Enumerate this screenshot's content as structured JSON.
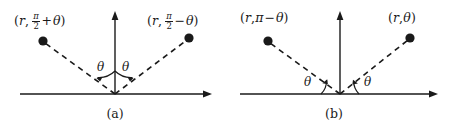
{
  "figure": {
    "background_color": "#ffffff",
    "ink_color": "#1a1a1a",
    "width": 451,
    "height": 132
  },
  "panels": [
    {
      "id": "a",
      "caption": "(a)",
      "symmetry": "reflection about the vertical (theta = pi/2) axis",
      "axes": {
        "origin_x": 115,
        "origin_y": 94,
        "x_axis_start": 20,
        "x_axis_end": 212,
        "y_axis_top": 12
      },
      "points": [
        {
          "name": "left-point",
          "dot_x": 43,
          "dot_y": 41,
          "label_prefix": "(",
          "label_r": "r",
          "label_comma": ",",
          "frac_num": "π",
          "frac_den": "2",
          "label_operator": "+",
          "label_theta": "θ",
          "label_suffix": ")",
          "label_x": 14,
          "label_y": 12
        },
        {
          "name": "right-point",
          "dot_x": 189,
          "dot_y": 38,
          "label_prefix": "(",
          "label_r": "r",
          "label_comma": ",",
          "frac_num": "π",
          "frac_den": "2",
          "label_operator": "−",
          "label_theta": "θ",
          "label_suffix": ")",
          "label_x": 147,
          "label_y": 12
        }
      ],
      "angle_marks": [
        {
          "name": "left-angle",
          "symbol": "θ",
          "label_x": 97,
          "label_y": 61,
          "measured_from": "vertical-axis"
        },
        {
          "name": "right-angle",
          "symbol": "θ",
          "label_x": 122,
          "label_y": 61,
          "measured_from": "vertical-axis"
        }
      ],
      "caption_x": 115,
      "caption_y": 108
    },
    {
      "id": "b",
      "caption": "(b)",
      "symmetry": "reflection about the vertical axis using theta and pi minus theta",
      "axes": {
        "origin_x": 340,
        "origin_y": 94,
        "x_axis_start": 240,
        "x_axis_end": 438,
        "y_axis_top": 12
      },
      "points": [
        {
          "name": "left-point",
          "dot_x": 268,
          "dot_y": 41,
          "label_prefix": "(",
          "label_r": "r",
          "label_comma": ",",
          "label_pi": "π",
          "label_operator": "−",
          "label_theta": "θ",
          "label_suffix": ")",
          "label_x": 240,
          "label_y": 12
        },
        {
          "name": "right-point",
          "dot_x": 410,
          "dot_y": 38,
          "label_prefix": "(",
          "label_r": "r",
          "label_comma": ",",
          "label_theta": "θ",
          "label_suffix": ")",
          "label_x": 388,
          "label_y": 12
        }
      ],
      "angle_marks": [
        {
          "name": "left-angle",
          "symbol": "θ",
          "label_x": 304,
          "label_y": 76,
          "measured_from": "horizontal-axis"
        },
        {
          "name": "right-angle",
          "symbol": "θ",
          "label_x": 364,
          "label_y": 76,
          "measured_from": "horizontal-axis"
        }
      ],
      "caption_x": 334,
      "caption_y": 108
    }
  ]
}
